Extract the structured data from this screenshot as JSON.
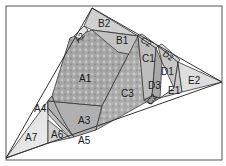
{
  "diagram": {
    "type": "paper-piecing-pattern",
    "frame": {
      "x": 6,
      "y": 6,
      "width": 216,
      "height": 154,
      "stroke": "#555555"
    },
    "colors": {
      "fabric_dark": "#9a9a9a",
      "fabric_mid": "#b4b4b4",
      "fabric_light": "#d2d2d2",
      "fabric_pale": "#e6e6e6",
      "line": "#333333",
      "background": "#ffffff"
    },
    "labels": {
      "A1": "A1",
      "A2": "A2",
      "A3": "A3",
      "A4": "A4",
      "A5": "A5",
      "A6": "A6",
      "A7": "A7",
      "B1": "B1",
      "B2": "B2",
      "C1": "C1",
      "C2": "C2",
      "C3": "C3",
      "D1": "D1",
      "D2": "D2",
      "D3": "D3",
      "E1": "E1",
      "E2": "E2"
    },
    "sections": [
      "A",
      "B",
      "C",
      "D",
      "E"
    ]
  }
}
